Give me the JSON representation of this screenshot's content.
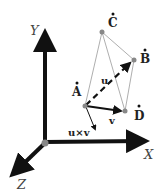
{
  "diagram": {
    "axes": {
      "x_label": "X",
      "y_label": "Y",
      "z_label": "Z"
    },
    "points": {
      "A": "A",
      "B": "B",
      "C": "C",
      "D": "D"
    },
    "vectors": {
      "u": "u",
      "v": "v",
      "cross": "u×v"
    },
    "colors": {
      "axis": "#111111",
      "edge": "#999999",
      "vertex": "#888888",
      "text": "#222222"
    }
  }
}
